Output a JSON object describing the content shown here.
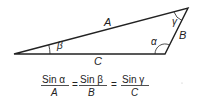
{
  "diagram": {
    "triangle": {
      "vertices": {
        "left": [
          14,
          54
        ],
        "top_right": [
          188,
          8
        ],
        "bottom_right": [
          165,
          54
        ]
      },
      "sides": {
        "A": "A",
        "B": "B",
        "C": "C"
      },
      "angles": {
        "alpha": "α",
        "beta": "β",
        "gamma": "γ"
      }
    },
    "formula": {
      "term1": {
        "numerator": "Sin α",
        "denominator": "A"
      },
      "eq1": "=",
      "term2": {
        "numerator": "Sin β",
        "denominator": "B"
      },
      "eq2": "=",
      "term3": {
        "numerator": "Sin γ",
        "denominator": "C"
      }
    },
    "colors": {
      "line": "#222222",
      "background": "#ffffff"
    }
  }
}
